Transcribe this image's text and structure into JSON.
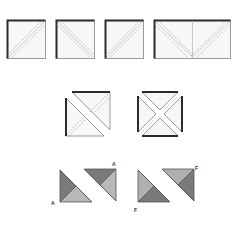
{
  "diagram": {
    "colors": {
      "outline": "#2a2a2a",
      "edge_light": "#9a9a9a",
      "fill_light": "#f6f6f6",
      "seam": "#8a8a8a",
      "dark_tri": "#7a7a7a",
      "mid_tri": "#9c9c9c",
      "light_tri": "#b8b8b8"
    },
    "row1": {
      "description": "Squares with diagonal stitching lines",
      "items": [
        {
          "type": "square",
          "diagonal": "bottom-left to top-right"
        },
        {
          "type": "square",
          "diagonal": "top-left to bottom-right"
        },
        {
          "type": "square",
          "diagonal": "bottom-left to top-right"
        },
        {
          "type": "rectangle",
          "diagonal": "two diagonals meeting at bottom center"
        }
      ]
    },
    "row2": {
      "description": "Cut squares separated into triangles",
      "items": [
        {
          "type": "square-cut-once",
          "pieces": 2
        },
        {
          "type": "square-cut-twice",
          "pieces": 4
        }
      ]
    },
    "row3": {
      "description": "Shaded pieced triangle units",
      "labels": [
        "A",
        "A",
        "F",
        "F"
      ]
    }
  }
}
